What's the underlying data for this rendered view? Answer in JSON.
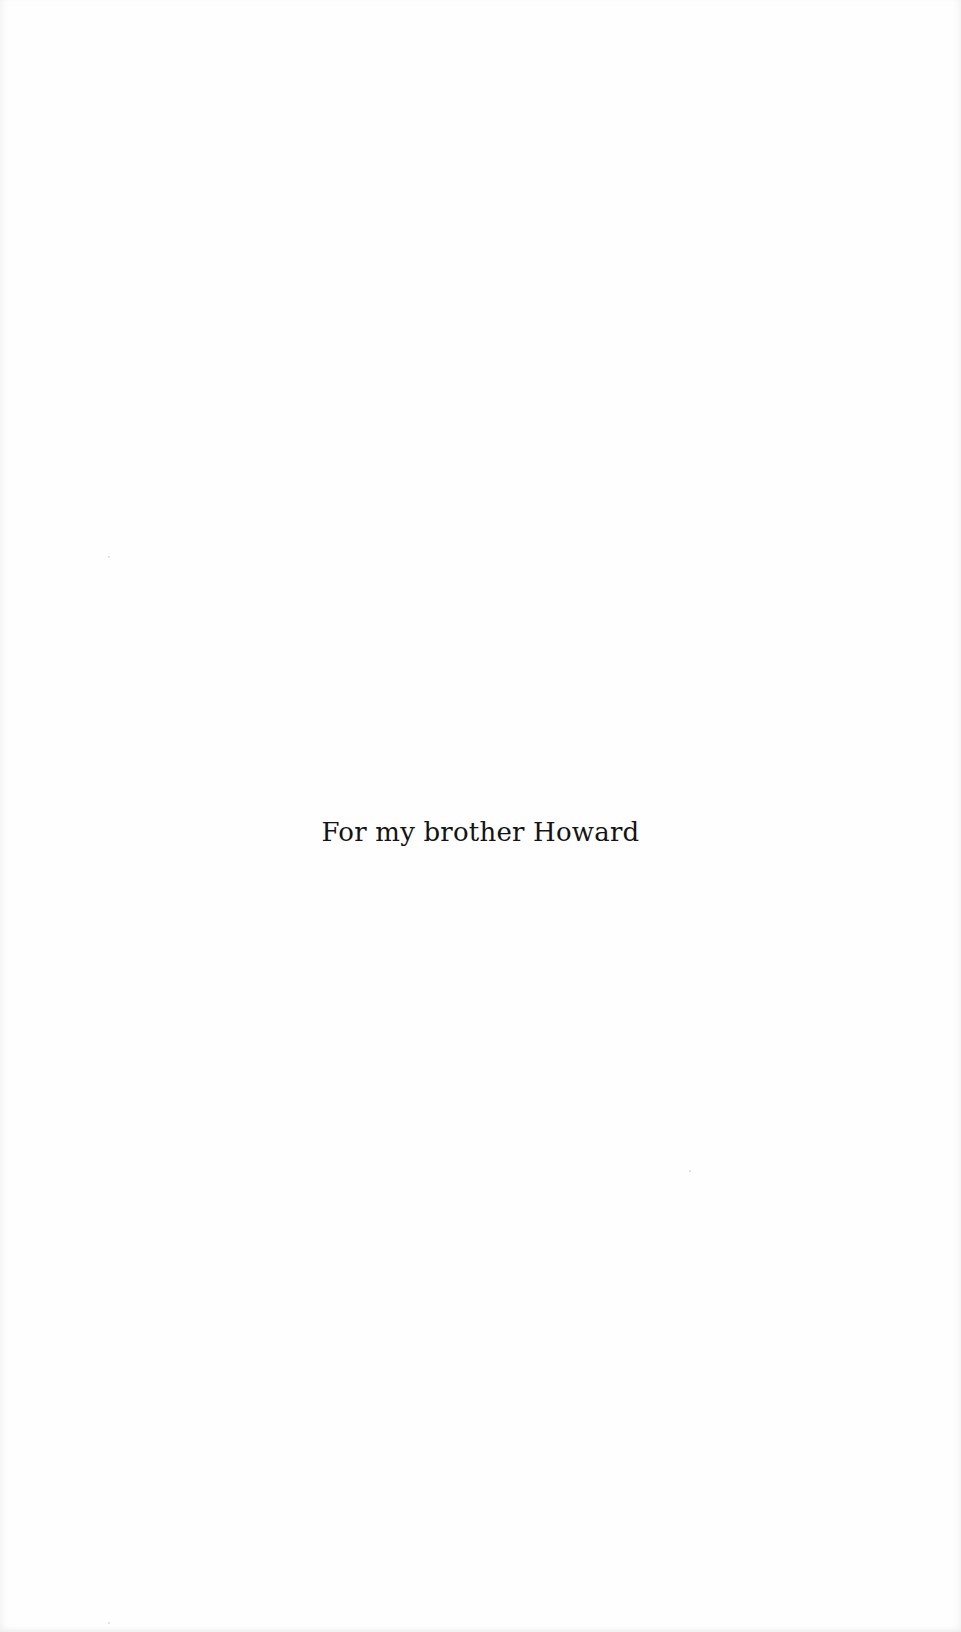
{
  "page": {
    "type": "dedication",
    "dedication_text": "For my brother Howard"
  }
}
